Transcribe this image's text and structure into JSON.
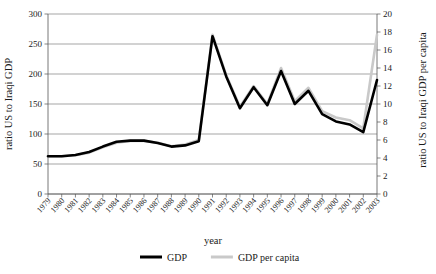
{
  "chart_data": {
    "type": "line",
    "title": "",
    "xlabel": "year",
    "ylabel": "ratio US to Iraqi GDP",
    "y2label": "ratio US to Iraqi GDP per capita",
    "ylim": [
      0,
      300
    ],
    "y2lim": [
      0,
      20
    ],
    "ytick_step": 50,
    "y2tick_step": 2,
    "grid": true,
    "legend_position": "bottom",
    "categories": [
      "1979",
      "1980",
      "1981",
      "1982",
      "1983",
      "1984",
      "1985",
      "1986",
      "1987",
      "1988",
      "1989",
      "1990",
      "1991",
      "1992",
      "1993",
      "1994",
      "1995",
      "1996",
      "1997",
      "1998",
      "1999",
      "2000",
      "2001",
      "2002",
      "2003"
    ],
    "yticks": [
      0,
      50,
      100,
      150,
      200,
      250,
      300
    ],
    "y2ticks": [
      0,
      2,
      4,
      6,
      8,
      10,
      12,
      14,
      16,
      18,
      20
    ],
    "series": [
      {
        "name": "GDP",
        "color": "#000000",
        "axis": "left",
        "values": [
          63,
          63,
          65,
          70,
          79,
          87,
          89,
          89,
          85,
          79,
          81,
          88,
          263,
          196,
          143,
          178,
          148,
          205,
          150,
          172,
          133,
          121,
          116,
          103,
          190
        ]
      },
      {
        "name": "GDP per capita",
        "color": "#c9c9c9",
        "axis": "right",
        "values": [
          4.2,
          4.2,
          4.3,
          4.6,
          5.2,
          5.7,
          5.9,
          5.9,
          5.7,
          5.3,
          5.5,
          6.0,
          17.7,
          13.2,
          9.7,
          12.0,
          10.0,
          14.0,
          10.3,
          11.8,
          9.2,
          8.5,
          8.2,
          7.3,
          17.7
        ]
      }
    ],
    "legend": [
      {
        "label": "GDP",
        "color": "#000000"
      },
      {
        "label": "GDP per capita",
        "color": "#c9c9c9"
      }
    ]
  }
}
